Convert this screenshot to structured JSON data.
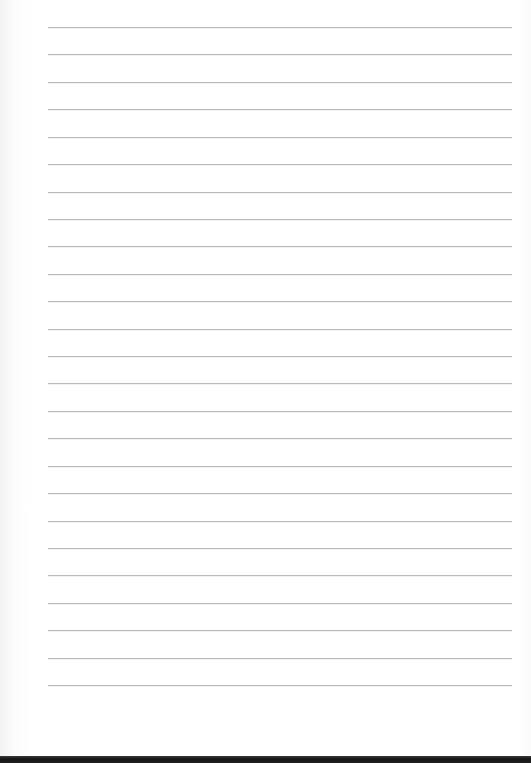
{
  "sheet": {
    "type": "lined-paper",
    "ruled_line_count": 25,
    "line_color": "#b9b9b9",
    "paper_color": "#ffffff",
    "edge_color": "#1a1a1a"
  }
}
